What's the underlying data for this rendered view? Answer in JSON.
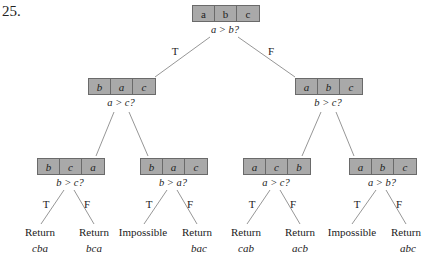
{
  "problem_number": "25.",
  "colors": {
    "node_fill": "#a9a9a9",
    "node_border": "#6a6a6a",
    "edge": "#8a8a8a"
  },
  "root": {
    "cells": [
      "a",
      "b",
      "c"
    ],
    "question": "a > b?"
  },
  "branch_labels": {
    "true": "T",
    "false": "F"
  },
  "level2": [
    {
      "cells": [
        "b",
        "a",
        "c"
      ],
      "question": "a > c?"
    },
    {
      "cells": [
        "a",
        "b",
        "c"
      ],
      "question": "b > c?"
    }
  ],
  "level3": [
    {
      "cells": [
        "b",
        "c",
        "a"
      ],
      "question": "b > c?"
    },
    {
      "cells": [
        "b",
        "a",
        "c"
      ],
      "question": "b > a?"
    },
    {
      "cells": [
        "a",
        "c",
        "b"
      ],
      "question": "a > c?"
    },
    {
      "cells": [
        "a",
        "b",
        "c"
      ],
      "question": "a > b?"
    }
  ],
  "leaves": [
    {
      "label": "Return",
      "value": "cba"
    },
    {
      "label": "Return",
      "value": "bca"
    },
    {
      "label": "Impossible",
      "value": ""
    },
    {
      "label": "Return",
      "value": "bac"
    },
    {
      "label": "Return",
      "value": "cab"
    },
    {
      "label": "Return",
      "value": "acb"
    },
    {
      "label": "Impossible",
      "value": ""
    },
    {
      "label": "Return",
      "value": "abc"
    }
  ]
}
